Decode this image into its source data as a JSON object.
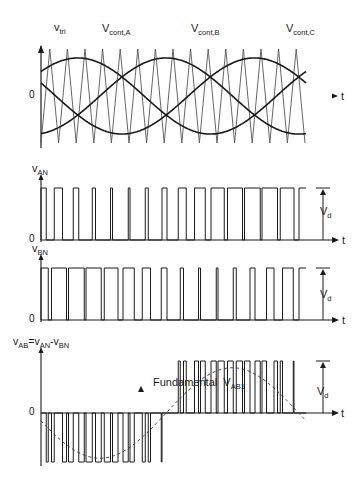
{
  "top_panel": {
    "labels": {
      "vtri_main": "v",
      "vtri_sub": "tri",
      "vcontA_main": "V",
      "vcontA_sub": "cont,A",
      "vcontB_main": "V",
      "vcontB_sub": "cont,B",
      "vcontC_main": "V",
      "vcontC_sub": "cont,C",
      "zero": "0",
      "t": "t"
    }
  },
  "van_panel": {
    "label_main": "v",
    "label_sub": "AN",
    "zero": "0",
    "vd_main": "V",
    "vd_sub": "d",
    "t": "t"
  },
  "vbn_panel": {
    "label_main": "v",
    "label_sub": "BN",
    "zero": "0",
    "vd_main": "V",
    "vd_sub": "d",
    "t": "t"
  },
  "vab_panel": {
    "label": {
      "p1": "v",
      "s1": "AB",
      "p2": "=v",
      "s2": "AN",
      "p3": "-v",
      "s3": "BN"
    },
    "fundamental_text": "Fundamental",
    "fundamental_main": "V",
    "fundamental_sub": "AB1",
    "zero": "0",
    "vd_main": "V",
    "vd_sub": "d",
    "t": "t"
  },
  "chart_data": {
    "type": "line",
    "carrier": {
      "name": "v_tri",
      "periods_shown": 15,
      "amplitude": 1.0
    },
    "control_signals": [
      {
        "name": "V_cont,A",
        "phase_deg": 0,
        "amplitude": 0.8
      },
      {
        "name": "V_cont,B",
        "phase_deg": -120,
        "amplitude": 0.8
      },
      {
        "name": "V_cont,C",
        "phase_deg": 120,
        "amplitude": 0.8
      }
    ],
    "fundamental_cycles_shown": 1.0,
    "outputs": [
      {
        "name": "v_AN",
        "levels": [
          "0",
          "V_d"
        ]
      },
      {
        "name": "v_BN",
        "levels": [
          "0",
          "V_d"
        ]
      },
      {
        "name": "v_AB = v_AN - v_BN",
        "levels": [
          "-V_d",
          "0",
          "V_d"
        ],
        "fundamental": "V_AB1"
      }
    ],
    "xlabel": "t",
    "ylabel_top": "0"
  },
  "geometry": {
    "x0": 41,
    "x1": 306,
    "top": {
      "zero_y": 96,
      "half_height": 47,
      "control_amp": 0.81,
      "phase_offset_deg": 160
    },
    "van": {
      "base_y": 240,
      "high_y": 188
    },
    "vbn": {
      "base_y": 320,
      "high_y": 268
    },
    "vab": {
      "zero_y": 413,
      "high_y": 361,
      "low_y": 462
    },
    "carrier_period_px": 17.6
  }
}
